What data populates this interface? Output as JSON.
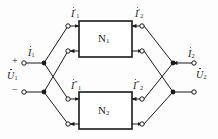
{
  "figure": {
    "type": "electrical-circuit-diagram",
    "line_color": "#1a1a1a",
    "background_color": "#fdfdfd",
    "box_fill": "#ffffff"
  },
  "blocks": [
    {
      "name": "N",
      "subscript": "1",
      "label": "N₁"
    },
    {
      "name": "N",
      "subscript": "2",
      "label": "N₂"
    }
  ],
  "port_labels": {
    "input_current": {
      "symbol": "I",
      "subscript": "1",
      "prime": "",
      "label": "İ₁"
    },
    "input_voltage": {
      "symbol": "U",
      "subscript": "1",
      "prime": "",
      "label": "U̇₁"
    },
    "output_current": {
      "symbol": "I",
      "subscript": "2",
      "prime": "",
      "label": "İ₂"
    },
    "output_voltage": {
      "symbol": "U",
      "subscript": "2",
      "prime": "",
      "label": "U̇₂"
    },
    "polarity_positive": "+",
    "polarity_negative": "−"
  },
  "branch_labels": {
    "n1_input_current": {
      "symbol": "I",
      "subscript": "1",
      "prime": "′",
      "label": "İ′₁"
    },
    "n1_output_current": {
      "symbol": "I",
      "subscript": "2",
      "prime": "′",
      "label": "İ′₂"
    },
    "n2_input_current": {
      "symbol": "I",
      "subscript": "1",
      "prime": "″",
      "label": "İ″₁"
    },
    "n2_output_current": {
      "symbol": "I",
      "subscript": "2",
      "prime": "″",
      "label": "İ″₂"
    }
  },
  "terminals": {
    "open_circle_count": 12,
    "filled_node_count": 4
  }
}
